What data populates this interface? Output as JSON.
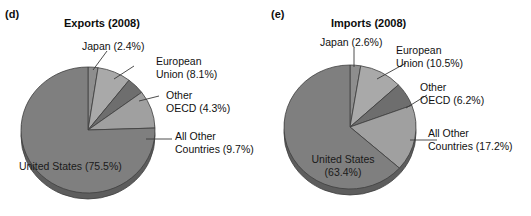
{
  "figure": {
    "background": "#ffffff",
    "panels": [
      {
        "letter": "(d)",
        "title": "Exports (2008)",
        "labels": {
          "japan": "Japan (2.4%)",
          "eu_line1": "European",
          "eu_line2": "Union (8.1%)",
          "oecd_line1": "Other",
          "oecd_line2": "OECD (4.3%)",
          "other_line1": "All Other",
          "other_line2": "Countries (9.7%)",
          "us": "United States (75.5%)"
        }
      },
      {
        "letter": "(e)",
        "title": "Imports (2008)",
        "labels": {
          "japan": "Japan (2.6%)",
          "eu_line1": "European",
          "eu_line2": "Union (10.5%)",
          "oecd_line1": "Other",
          "oecd_line2": "OECD (6.2%)",
          "other_line1": "All Other",
          "other_line2": "Countries (17.2%)",
          "us_line1": "United States",
          "us_line2": "(63.4%)"
        }
      }
    ]
  },
  "chart_data": [
    {
      "type": "pie",
      "title": "Exports (2008)",
      "panel": "(d)",
      "categories": [
        "Japan",
        "European Union",
        "Other OECD",
        "All Other Countries",
        "United States"
      ],
      "values": [
        2.4,
        8.1,
        4.3,
        9.7,
        75.5
      ],
      "unit": "percent",
      "labels": [
        "Japan (2.4%)",
        "European Union (8.1%)",
        "Other OECD (4.3%)",
        "All Other Countries (9.7%)",
        "United States (75.5%)"
      ],
      "colors": [
        "#8e8e8e",
        "#a9a9a9",
        "#6e6e6e",
        "#a0a0a0",
        "#7f7f7f"
      ],
      "start_angle_deg": 0,
      "direction": "clockwise",
      "legend": "none",
      "style": "3d-pie-with-depth"
    },
    {
      "type": "pie",
      "title": "Imports (2008)",
      "panel": "(e)",
      "categories": [
        "Japan",
        "European Union",
        "Other OECD",
        "All Other Countries",
        "United States"
      ],
      "values": [
        2.6,
        10.5,
        6.2,
        17.2,
        63.4
      ],
      "unit": "percent",
      "labels": [
        "Japan (2.6%)",
        "European Union (10.5%)",
        "Other OECD (6.2%)",
        "All Other Countries (17.2%)",
        "United States (63.4%)"
      ],
      "colors": [
        "#8e8e8e",
        "#a9a9a9",
        "#6e6e6e",
        "#a0a0a0",
        "#7f7f7f"
      ],
      "start_angle_deg": 0,
      "direction": "clockwise",
      "legend": "none",
      "style": "3d-pie-with-depth"
    }
  ]
}
